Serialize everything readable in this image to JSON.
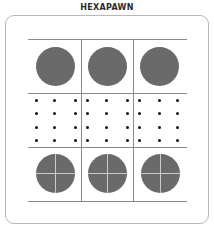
{
  "header": {
    "title": "HEXAPAWN"
  },
  "board": {
    "rows": 3,
    "cols": 3,
    "cells": [
      [
        {
          "piece": "opponent-pawn"
        },
        {
          "piece": "opponent-pawn"
        },
        {
          "piece": "opponent-pawn"
        }
      ],
      [
        {
          "piece": "empty"
        },
        {
          "piece": "empty"
        },
        {
          "piece": "empty"
        }
      ],
      [
        {
          "piece": "player-pawn"
        },
        {
          "piece": "player-pawn"
        },
        {
          "piece": "player-pawn"
        }
      ]
    ],
    "colors": {
      "pawn": "#6a6a6a",
      "cross": "#c9c9c9",
      "grid": "#8a8a8a",
      "frame": "#b8b8b8",
      "dot": "#111111"
    }
  }
}
